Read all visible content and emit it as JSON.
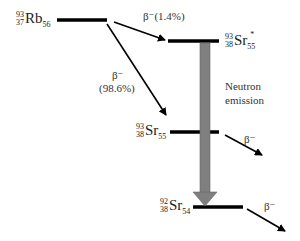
{
  "diagram": {
    "nuclides": {
      "rb93": {
        "A": "93",
        "Z": "37",
        "symbol": "Rb",
        "N": "56",
        "excited": ""
      },
      "sr93_excited": {
        "A": "93",
        "Z": "38",
        "symbol": "Sr",
        "N": "55",
        "excited": "*"
      },
      "sr93": {
        "A": "93",
        "Z": "38",
        "symbol": "Sr",
        "N": "55",
        "excited": ""
      },
      "sr92": {
        "A": "92",
        "Z": "38",
        "symbol": "Sr",
        "N": "54",
        "excited": ""
      }
    },
    "labels": {
      "beta_excited": "β⁻(1.4%)",
      "beta_ground_line1": "β⁻",
      "beta_ground_line2": "(98.6%)",
      "neutron_line1": "Neutron",
      "neutron_line2": "emission",
      "beta_sr93": "β⁻",
      "beta_sr92": "β⁻"
    },
    "colors": {
      "level_line": "#000000",
      "neutron_arrow": "#808080",
      "text": "#222222"
    }
  }
}
